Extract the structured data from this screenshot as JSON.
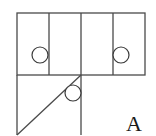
{
  "diagram": {
    "label": "A",
    "colors": {
      "line": "#4a4a4a",
      "background": "#ffffff"
    },
    "top_row": {
      "panels": 4
    },
    "circles": [
      {
        "id": "left-panel-circle",
        "cx": 40,
        "cy": 55,
        "r": 8
      },
      {
        "id": "right-panel-circle",
        "cx": 121,
        "cy": 55,
        "r": 8
      },
      {
        "id": "diagonal-circle",
        "cx": 73,
        "cy": 93,
        "r": 8
      }
    ]
  }
}
